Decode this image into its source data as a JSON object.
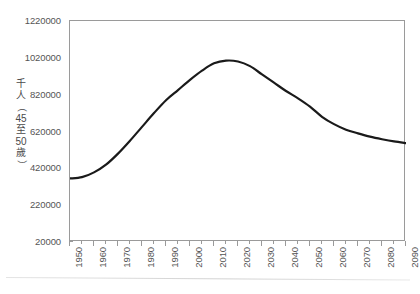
{
  "chart_data": {
    "type": "line",
    "title": "",
    "xlabel": "",
    "ylabel": "千人（45至50歲）",
    "ylabel_chars": [
      "千",
      "人",
      "（",
      "45",
      "至",
      "50",
      "歲",
      "）"
    ],
    "xlim": [
      1950,
      2090
    ],
    "ylim": [
      20000,
      1220000
    ],
    "grid": false,
    "legend": "none",
    "y_ticks": [
      20000,
      220000,
      420000,
      620000,
      820000,
      1020000,
      1220000
    ],
    "y_tick_labels": [
      "20000",
      "220000",
      "420000",
      "620000",
      "820000",
      "1020000",
      "1220000"
    ],
    "x_ticks": [
      1950,
      1960,
      1970,
      1980,
      1990,
      2000,
      2010,
      2020,
      2030,
      2040,
      2050,
      2060,
      2070,
      2080,
      2090
    ],
    "x_tick_labels": [
      "1950",
      "1960",
      "1970",
      "1980",
      "1990",
      "2000",
      "2010",
      "2020",
      "2030",
      "2040",
      "2050",
      "2060",
      "2070",
      "2080",
      "2090"
    ],
    "x_minor_step": 5,
    "series": [
      {
        "name": "45至50歲人口",
        "color": "#1a1a1a",
        "line_width": 2.2,
        "x": [
          1950,
          1955,
          1960,
          1965,
          1970,
          1975,
          1980,
          1985,
          1990,
          1995,
          2000,
          2005,
          2010,
          2015,
          2020,
          2025,
          2030,
          2035,
          2040,
          2045,
          2050,
          2055,
          2060,
          2065,
          2070,
          2075,
          2080,
          2085,
          2090
        ],
        "values": [
          365000,
          372000,
          398000,
          440000,
          500000,
          570000,
          645000,
          720000,
          790000,
          845000,
          900000,
          950000,
          990000,
          1005000,
          1000000,
          975000,
          930000,
          885000,
          840000,
          800000,
          755000,
          700000,
          660000,
          630000,
          610000,
          592000,
          578000,
          566000,
          557000
        ]
      }
    ]
  },
  "axis": {
    "plot_left": 69,
    "plot_top": 20,
    "plot_width": 336,
    "plot_height": 221
  },
  "colors": {
    "line": "#1a1a1a",
    "frame": "#9a9a9a",
    "tick_text": "#555555",
    "background": "#ffffff"
  }
}
